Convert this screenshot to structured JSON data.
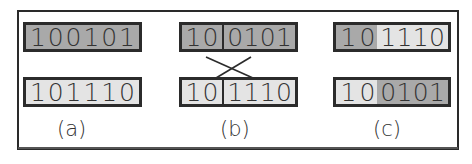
{
  "figure": {
    "panels": [
      {
        "id": "a",
        "label": "(a)",
        "top": {
          "segments": [
            {
              "bits": [
                "1",
                "0",
                "0",
                "1",
                "0",
                "1"
              ],
              "shade": "dark"
            }
          ]
        },
        "bottom": {
          "segments": [
            {
              "bits": [
                "1",
                "0",
                "1",
                "1",
                "1",
                "0"
              ],
              "shade": "light"
            }
          ]
        }
      },
      {
        "id": "b",
        "label": "(b)",
        "top": {
          "segments": [
            {
              "bits": [
                "1",
                "0"
              ],
              "shade": "dark"
            },
            {
              "bits": [
                "0",
                "1",
                "0",
                "1"
              ],
              "shade": "dark"
            }
          ]
        },
        "bottom": {
          "segments": [
            {
              "bits": [
                "1",
                "0"
              ],
              "shade": "light"
            },
            {
              "bits": [
                "1",
                "1",
                "1",
                "0"
              ],
              "shade": "light"
            }
          ]
        },
        "crossover": true
      },
      {
        "id": "c",
        "label": "(c)",
        "top": {
          "segments": [
            {
              "bits": [
                "1",
                "0"
              ],
              "shade": "dark"
            },
            {
              "bits": [
                "1",
                "1",
                "1",
                "0"
              ],
              "shade": "light"
            }
          ]
        },
        "bottom": {
          "segments": [
            {
              "bits": [
                "1",
                "0"
              ],
              "shade": "light"
            },
            {
              "bits": [
                "0",
                "1",
                "0",
                "1"
              ],
              "shade": "dark"
            }
          ]
        }
      }
    ],
    "colors": {
      "dark": "#a9a9a9",
      "light": "#e4e4e4",
      "border": "#2b2b2b"
    }
  }
}
